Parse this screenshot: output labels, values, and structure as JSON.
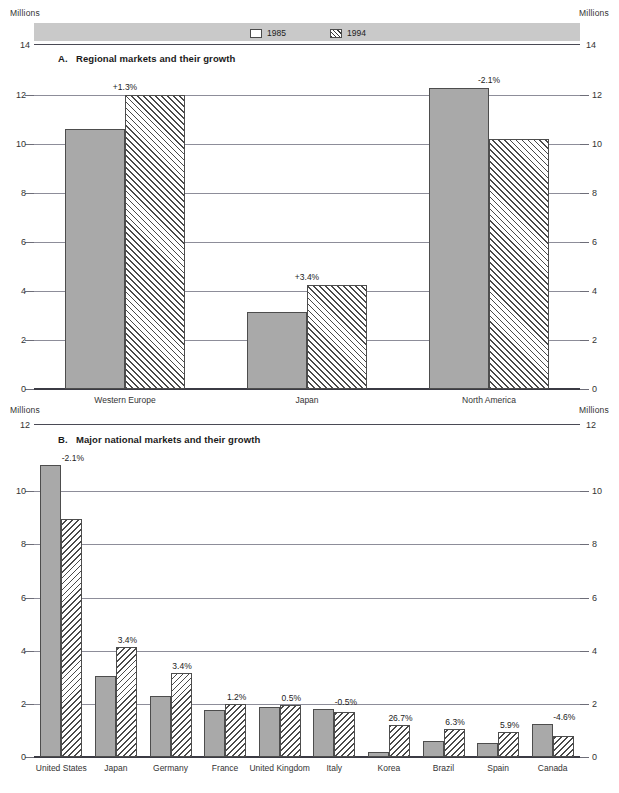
{
  "legend": {
    "items": [
      {
        "label": "1985",
        "swatch": "solid-square-swatch"
      },
      {
        "label": "1994",
        "swatch": "hatched-square-swatch"
      }
    ]
  },
  "units": {
    "top_left": "Millions",
    "top_right": "Millions",
    "mid_left": "Millions",
    "mid_right": "Millions"
  },
  "top_axis": {
    "left": "14",
    "right": "14"
  },
  "mid_axis": {
    "left": "12",
    "right": "12"
  },
  "sections": {
    "a": {
      "marker": "A.",
      "title": "Regional markets and their growth"
    },
    "b": {
      "marker": "B.",
      "title": "Major national markets and their growth"
    }
  },
  "chart_data": [
    {
      "type": "bar",
      "id": "chart-a",
      "title": "A.  Regional markets and their growth",
      "xlabel": "",
      "ylabel": "Millions",
      "ylim": [
        0,
        12
      ],
      "yticks": [
        0,
        2,
        4,
        6,
        8,
        10,
        12
      ],
      "ytick_labels": [
        "0",
        "2",
        "4",
        "6",
        "8",
        "10",
        "12"
      ],
      "grid": true,
      "legend": [
        "1985",
        "1994"
      ],
      "legend_position": "top",
      "categories": [
        "Western Europe",
        "Japan",
        "North America"
      ],
      "series": [
        {
          "name": "1985",
          "values": [
            10.6,
            3.15,
            12.3
          ]
        },
        {
          "name": "1994",
          "values": [
            12.0,
            4.25,
            10.2
          ]
        }
      ],
      "annotations": [
        "+1.3%",
        "+3.4%",
        "-2.1%"
      ]
    },
    {
      "type": "bar",
      "id": "chart-b",
      "title": "B.  Major national markets and their growth",
      "xlabel": "",
      "ylabel": "Millions",
      "ylim": [
        0,
        12
      ],
      "yticks": [
        0,
        2,
        4,
        6,
        8,
        10
      ],
      "ytick_labels": [
        "0",
        "2",
        "4",
        "6",
        "8",
        "10"
      ],
      "grid": true,
      "legend": [
        "1985",
        "1994"
      ],
      "legend_position": "top",
      "categories": [
        "United States",
        "Japan",
        "Germany",
        "France",
        "United Kingdom",
        "Italy",
        "Korea",
        "Brazil",
        "Spain",
        "Canada"
      ],
      "series": [
        {
          "name": "1985",
          "values": [
            11.0,
            3.05,
            2.3,
            1.78,
            1.87,
            1.8,
            0.17,
            0.62,
            0.52,
            1.25
          ]
        },
        {
          "name": "1994",
          "values": [
            8.95,
            4.15,
            3.15,
            2.0,
            1.95,
            1.7,
            1.2,
            1.05,
            0.95,
            0.8
          ]
        }
      ],
      "annotations": [
        "-2.1%",
        "3.4%",
        "3.4%",
        "1.2%",
        "0.5%",
        "-0.5%",
        "26.7%",
        "6.3%",
        "5.9%",
        "-4.6%"
      ]
    }
  ],
  "colors": {
    "bar_1985_fill": "#a9a9a9",
    "bar_stroke": "#4d4d4d",
    "gridline": "#8d8d99",
    "legend_band": "#c9c9c9",
    "text": "#222222"
  }
}
